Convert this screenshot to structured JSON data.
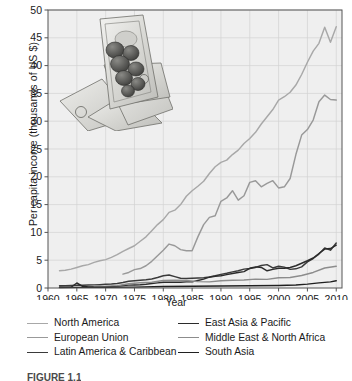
{
  "chart_data": {
    "type": "line",
    "title": "",
    "xlabel": "Year",
    "ylabel": "Per capita income (thousands of US $)",
    "xlim": [
      1960,
      2011
    ],
    "ylim": [
      0,
      50
    ],
    "xticks": [
      1960,
      1965,
      1970,
      1975,
      1980,
      1985,
      1990,
      1995,
      2000,
      2005,
      2010
    ],
    "yticks": [
      0,
      5,
      10,
      15,
      20,
      25,
      30,
      35,
      40,
      45,
      50
    ],
    "grid": true,
    "legend_position": "below-axes",
    "series": [
      {
        "name": "North America",
        "color": "#a8a8a8",
        "x": [
          1962,
          1963,
          1964,
          1965,
          1966,
          1967,
          1968,
          1969,
          1970,
          1971,
          1972,
          1973,
          1974,
          1975,
          1976,
          1977,
          1978,
          1979,
          1980,
          1981,
          1982,
          1983,
          1984,
          1985,
          1986,
          1987,
          1988,
          1989,
          1990,
          1991,
          1992,
          1993,
          1994,
          1995,
          1996,
          1997,
          1998,
          1999,
          2000,
          2001,
          2002,
          2003,
          2004,
          2005,
          2006,
          2007,
          2008,
          2009,
          2010
        ],
        "values": [
          3.1,
          3.2,
          3.4,
          3.7,
          4.0,
          4.2,
          4.6,
          4.9,
          5.1,
          5.5,
          6.0,
          6.6,
          7.1,
          7.6,
          8.4,
          9.2,
          10.3,
          11.4,
          12.3,
          13.6,
          14.0,
          15.0,
          16.5,
          17.5,
          18.3,
          19.2,
          20.6,
          21.8,
          22.6,
          23.0,
          24.0,
          24.8,
          26.0,
          26.9,
          28.0,
          29.5,
          30.8,
          32.1,
          33.8,
          34.4,
          35.2,
          36.5,
          38.4,
          40.6,
          42.6,
          44.0,
          46.9,
          44.2,
          47.0
        ]
      },
      {
        "name": "European Union",
        "color": "#999999",
        "x": [
          1973,
          1974,
          1975,
          1976,
          1977,
          1978,
          1979,
          1980,
          1981,
          1982,
          1983,
          1984,
          1985,
          1986,
          1987,
          1988,
          1989,
          1990,
          1991,
          1992,
          1993,
          1994,
          1995,
          1996,
          1997,
          1998,
          1999,
          2000,
          2001,
          2002,
          2003,
          2004,
          2005,
          2006,
          2007,
          2008,
          2009,
          2010
        ],
        "values": [
          2.5,
          2.8,
          3.3,
          3.5,
          4.0,
          4.8,
          5.8,
          6.8,
          7.9,
          7.6,
          6.9,
          6.7,
          6.7,
          9.2,
          11.4,
          12.7,
          13.0,
          15.6,
          16.2,
          17.5,
          15.8,
          16.6,
          19.0,
          19.3,
          18.2,
          18.8,
          19.3,
          18.0,
          18.2,
          19.7,
          24.0,
          27.5,
          28.5,
          30.2,
          33.5,
          34.7,
          33.9,
          33.8
        ]
      },
      {
        "name": "Latin America & Caribbean",
        "color": "#3a3a3a",
        "x": [
          1962,
          1963,
          1964,
          1965,
          1966,
          1967,
          1968,
          1969,
          1970,
          1971,
          1972,
          1973,
          1974,
          1975,
          1976,
          1977,
          1978,
          1979,
          1980,
          1981,
          1982,
          1983,
          1984,
          1985,
          1986,
          1987,
          1988,
          1989,
          1990,
          1991,
          1992,
          1993,
          1994,
          1995,
          1996,
          1997,
          1998,
          1999,
          2000,
          2001,
          2002,
          2003,
          2004,
          2005,
          2006,
          2007,
          2008,
          2009,
          2010
        ],
        "values": [
          0.42,
          0.43,
          0.46,
          0.48,
          0.51,
          0.53,
          0.56,
          0.6,
          0.66,
          0.72,
          0.82,
          1.0,
          1.22,
          1.3,
          1.4,
          1.5,
          1.63,
          1.9,
          2.2,
          2.35,
          2.05,
          1.75,
          1.7,
          1.75,
          1.8,
          1.85,
          2.0,
          2.2,
          2.45,
          2.65,
          2.9,
          3.1,
          3.4,
          3.5,
          3.7,
          4.05,
          4.2,
          3.6,
          3.9,
          3.75,
          3.35,
          3.45,
          3.8,
          4.7,
          5.3,
          6.1,
          7.2,
          6.8,
          8.1
        ]
      },
      {
        "name": "East Asia & Pacific",
        "color": "#2b2b2b",
        "x": [
          1962,
          1963,
          1964,
          1965,
          1966,
          1967,
          1968,
          1969,
          1970,
          1971,
          1972,
          1973,
          1974,
          1975,
          1976,
          1977,
          1978,
          1979,
          1980,
          1981,
          1982,
          1983,
          1984,
          1985,
          1986,
          1987,
          1988,
          1989,
          1990,
          1991,
          1992,
          1993,
          1994,
          1995,
          1996,
          1997,
          1998,
          1999,
          2000,
          2001,
          2002,
          2003,
          2004,
          2005,
          2006,
          2007,
          2008,
          2009,
          2010
        ],
        "values": [
          0.12,
          0.13,
          0.14,
          0.9,
          0.3,
          0.18,
          0.2,
          0.22,
          0.25,
          0.28,
          0.34,
          0.44,
          0.52,
          0.55,
          0.58,
          0.66,
          0.8,
          0.92,
          1.02,
          1.05,
          1.02,
          1.05,
          1.1,
          1.1,
          1.35,
          1.6,
          1.95,
          2.1,
          2.2,
          2.4,
          2.6,
          2.8,
          2.95,
          3.55,
          3.8,
          3.7,
          3.1,
          3.35,
          3.55,
          3.55,
          3.7,
          4.0,
          4.45,
          4.9,
          5.4,
          6.2,
          7.0,
          7.1,
          7.7
        ]
      },
      {
        "name": "Middle East & North Africa",
        "color": "#8c8c8c",
        "x": [
          1968,
          1970,
          1972,
          1974,
          1976,
          1978,
          1980,
          1982,
          1984,
          1986,
          1988,
          1990,
          1992,
          1994,
          1996,
          1998,
          2000,
          2002,
          2004,
          2006,
          2008,
          2010
        ],
        "values": [
          0.25,
          0.3,
          0.4,
          0.75,
          0.95,
          1.05,
          1.35,
          1.4,
          1.35,
          1.15,
          1.1,
          1.3,
          1.4,
          1.45,
          1.6,
          1.55,
          1.85,
          1.9,
          2.25,
          2.8,
          3.6,
          3.9
        ]
      },
      {
        "name": "South Asia",
        "color": "#202020",
        "x": [
          1962,
          1965,
          1970,
          1975,
          1980,
          1985,
          1990,
          1995,
          2000,
          2003,
          2005,
          2007,
          2009,
          2010
        ],
        "values": [
          0.09,
          0.11,
          0.12,
          0.16,
          0.27,
          0.3,
          0.37,
          0.4,
          0.46,
          0.55,
          0.7,
          0.92,
          1.1,
          1.3
        ]
      }
    ]
  },
  "axis": {
    "ylabel": "Per capita income (thousands of US $)",
    "xlabel": "Year",
    "ytick_labels": [
      "0",
      "5",
      "10",
      "15",
      "20",
      "25",
      "30",
      "35",
      "40",
      "45",
      "50"
    ],
    "xtick_labels": [
      "1960",
      "1965",
      "1970",
      "1975",
      "1980",
      "1985",
      "1990",
      "1995",
      "2000",
      "2005",
      "2010"
    ]
  },
  "legend": {
    "left_column": [
      {
        "label": "North America",
        "color": "#a8a8a8"
      },
      {
        "label": "European Union",
        "color": "#999999"
      },
      {
        "label": "Latin America & Caribbean",
        "color": "#3a3a3a"
      }
    ],
    "right_column": [
      {
        "label": "East Asia & Pacific",
        "color": "#2b2b2b"
      },
      {
        "label": "Middle East & North Africa",
        "color": "#8c8c8c"
      },
      {
        "label": "South Asia",
        "color": "#202020"
      }
    ]
  },
  "caption": {
    "text": "FIGURE 1.1"
  },
  "decoration": {
    "image_alt": "photo of US dollar banknotes and coins"
  },
  "colors": {
    "plot_background": "#efefef",
    "grid": "#d2d2d2",
    "frame": "#555555",
    "text": "#1a1a1a"
  }
}
